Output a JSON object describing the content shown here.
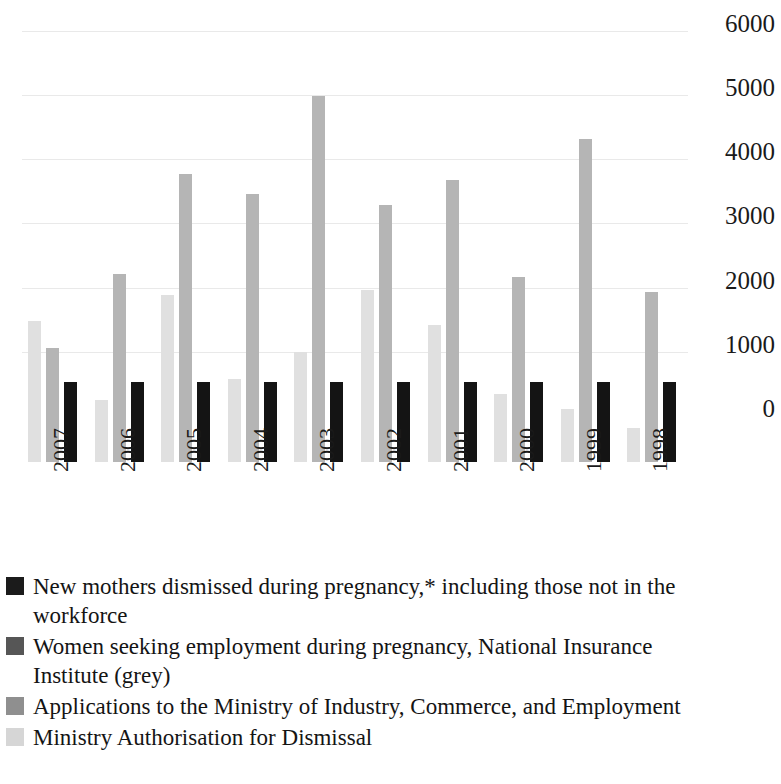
{
  "chart_data": {
    "type": "bar",
    "title": "",
    "subtitle": "",
    "xlabel": "",
    "ylabel": "",
    "ylim": [
      0,
      6000
    ],
    "y_ticks": [
      "0",
      "1000",
      "2000",
      "3000",
      "4000",
      "5000",
      "6000"
    ],
    "y_tick_values": [
      0,
      1000,
      2000,
      3000,
      4000,
      5000,
      6000
    ],
    "grid": true,
    "grid_axis": "y",
    "legend_position": "below",
    "orientation": "vertical",
    "grouping": "grouped",
    "categories": [
      "2007",
      "2006",
      "2005",
      "2004",
      "2003",
      "2002",
      "2001",
      "2000",
      "1999",
      "1998"
    ],
    "series": [
      {
        "name": "New mothers dismissed during pregnancy,* including those not in the workforce",
        "color": "#141414",
        "values": [
          1250,
          1250,
          1250,
          1250,
          1250,
          1250,
          1250,
          1250,
          1250,
          1250
        ]
      },
      {
        "name": "Women seeking employment during pregnancy, National Insurance Institute (grey)",
        "color": "#6e6e6e",
        "values": [
          null,
          null,
          null,
          null,
          null,
          null,
          null,
          null,
          null,
          null
        ]
      },
      {
        "name": "Applications to the Ministry of Industry, Commerce, and Employment",
        "color": "#b5b5b5",
        "values": [
          1780,
          2930,
          4480,
          4180,
          5700,
          4000,
          4400,
          2880,
          5030,
          2650
        ]
      },
      {
        "name": "Ministry Authorisation for Dismissal",
        "color": "#e0e0e0",
        "values": [
          2200,
          960,
          2600,
          1300,
          1720,
          2680,
          2130,
          1060,
          830,
          530
        ]
      }
    ]
  },
  "axis": {
    "y_ticks": [
      "6000",
      "5000",
      "4000",
      "3000",
      "2000",
      "1000",
      "0"
    ],
    "x_ticks": [
      "2007",
      "2006",
      "2005",
      "2004",
      "2003",
      "2002",
      "2001",
      "2000",
      "1999",
      "1998"
    ]
  },
  "legend": {
    "entries": [
      {
        "swatch": "black",
        "label": "New mothers dismissed during pregnancy,* including those not in the workforce"
      },
      {
        "swatch": "dark",
        "label": "Women seeking employment during pregnancy, National Insurance Institute (grey)"
      },
      {
        "swatch": "medium",
        "label": "Applications to the Ministry of Industry, Commerce, and Employment"
      },
      {
        "swatch": "light",
        "label": "Ministry Authorisation for Dismissal"
      }
    ]
  },
  "colors": {
    "series_black": "#141414",
    "series_dark": "#6e6e6e",
    "series_medium": "#b5b5b5",
    "series_light": "#e0e0e0",
    "gridline": "#e9e9e9",
    "background": "#ffffff",
    "text": "#1a1a1a"
  }
}
